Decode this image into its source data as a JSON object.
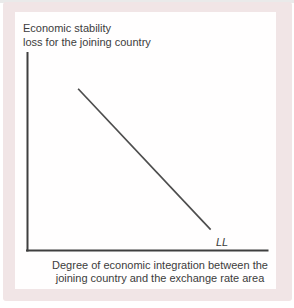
{
  "figure": {
    "ylabel_line1": "Economic stability",
    "ylabel_line2": "loss for the joining country",
    "xlabel_line1": "Degree of economic integration between the",
    "xlabel_line2": "joining country and the exchange rate area",
    "curve_label": "LL"
  },
  "colors": {
    "frame": "#f1e5e6",
    "panel": "#fffefe",
    "axis": "#3f3f3f",
    "curve": "#4d4d4d",
    "text": "#3c3c3c"
  },
  "chart_data": {
    "type": "line",
    "title": "",
    "xlabel": "Degree of economic integration between the joining country and the exchange rate area",
    "ylabel": "Economic stability loss for the joining country",
    "xlim": [
      0,
      1
    ],
    "ylim": [
      0,
      1
    ],
    "grid": false,
    "legend": "none",
    "axis_ticks": "none",
    "series": [
      {
        "name": "LL",
        "x": [
          0.21,
          0.76
        ],
        "y": [
          0.815,
          0.105
        ],
        "label_position": "below-right-end"
      }
    ]
  }
}
